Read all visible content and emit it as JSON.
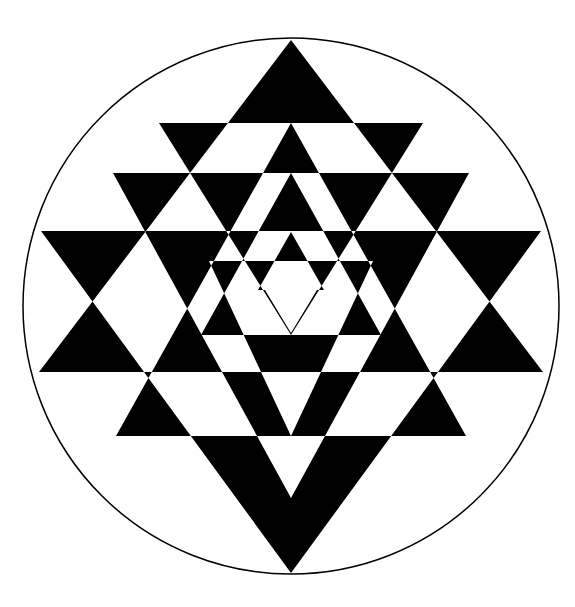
{
  "figure": {
    "name": "Sri Yantra",
    "width": 575,
    "height": 607,
    "background": "#ffffff",
    "ink": "#000000",
    "circle": {
      "cx": 291,
      "cy": 306,
      "r": 268,
      "stroke_width": 1.5
    },
    "center_dot": {
      "cx": 292,
      "cy": 306,
      "r": 2.5,
      "color": "#ffffff"
    },
    "center_x": 291,
    "upward_triangles": [
      {
        "id": "U1",
        "apex_y": 40,
        "base_y": 372,
        "half_width": 252
      },
      {
        "id": "U2",
        "apex_y": 123,
        "base_y": 436,
        "half_width": 175
      },
      {
        "id": "U3",
        "apex_y": 173,
        "base_y": 335,
        "half_width": 90
      },
      {
        "id": "U4",
        "apex_y": 232,
        "base_y": 290,
        "half_width": 33
      }
    ],
    "downward_triangles": [
      {
        "id": "D1",
        "base_y": 231,
        "apex_y": 573,
        "half_width": 250
      },
      {
        "id": "D2",
        "base_y": 173,
        "apex_y": 498,
        "half_width": 178
      },
      {
        "id": "D3",
        "base_y": 123,
        "apex_y": 335,
        "half_width": 132
      },
      {
        "id": "D4",
        "base_y": 261,
        "apex_y": 436,
        "half_width": 82
      },
      {
        "id": "D5",
        "base_y": 290,
        "apex_y": 333,
        "half_width": 26
      }
    ]
  }
}
